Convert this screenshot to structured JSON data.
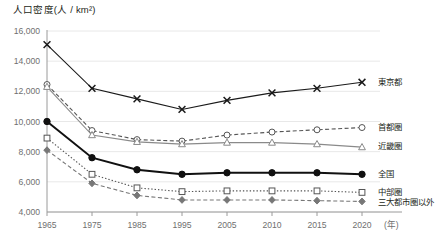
{
  "chart_data": {
    "type": "line",
    "title": "",
    "ylabel": "人口密度(人 / km²)",
    "xlabel": "(年)",
    "ylim": [
      4000,
      16000
    ],
    "ytick_step": 2000,
    "ytick_labels": [
      "16,000",
      "14,000",
      "12,000",
      "10,000",
      "8,000",
      "6,000",
      "4,000"
    ],
    "grid": true,
    "legend_position": "right",
    "categories": [
      "1965",
      "1975",
      "1985",
      "1995",
      "2005",
      "2010",
      "2015",
      "2020"
    ],
    "x": [
      1965,
      1975,
      1985,
      1995,
      2005,
      2010,
      2015,
      2020
    ],
    "series": [
      {
        "name": "東京都",
        "marker": "x-cross",
        "line": "solid",
        "color": "#1a1a1a",
        "values": [
          15100,
          12200,
          11500,
          10800,
          11400,
          11900,
          12200,
          12600
        ]
      },
      {
        "name": "首都圏",
        "marker": "open-circle",
        "line": "dashed",
        "color": "#555555",
        "values": [
          12450,
          9400,
          8800,
          8700,
          9100,
          9300,
          9450,
          9600
        ]
      },
      {
        "name": "近畿圏",
        "marker": "open-triangle",
        "line": "solid",
        "color": "#8a8a8a",
        "values": [
          12300,
          9100,
          8650,
          8500,
          8600,
          8600,
          8500,
          8300
        ]
      },
      {
        "name": "全国",
        "marker": "filled-circle",
        "line": "solid-thick",
        "color": "#111111",
        "values": [
          10000,
          7600,
          6800,
          6500,
          6600,
          6600,
          6600,
          6500
        ]
      },
      {
        "name": "中部圏",
        "marker": "open-square",
        "line": "dotted",
        "color": "#555555",
        "values": [
          8900,
          6500,
          5600,
          5350,
          5400,
          5400,
          5400,
          5300
        ]
      },
      {
        "name": "三大都市圏以外",
        "marker": "filled-diamond",
        "line": "dashed",
        "color": "#777777",
        "values": [
          8100,
          5900,
          5100,
          4800,
          4800,
          4800,
          4750,
          4700
        ]
      }
    ]
  }
}
